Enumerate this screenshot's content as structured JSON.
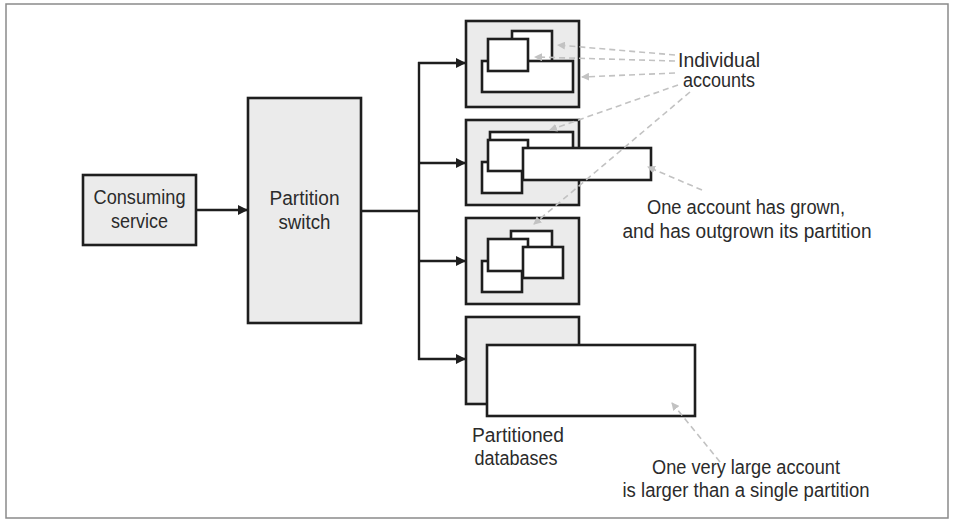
{
  "diagram": {
    "consuming_service": {
      "line1": "Consuming",
      "line2": "service"
    },
    "partition_switch": {
      "line1": "Partition",
      "line2": "switch"
    },
    "partitioned_databases": {
      "line1": "Partitioned",
      "line2": "databases"
    },
    "partitions": [
      {
        "name": "partition-1",
        "accounts": 3
      },
      {
        "name": "partition-2",
        "accounts": 4,
        "note": "one account outgrown"
      },
      {
        "name": "partition-3",
        "accounts": 4
      },
      {
        "name": "partition-4",
        "accounts": 1,
        "note": "very large account exceeds partition"
      }
    ],
    "callouts": {
      "individual_accounts": {
        "line1": "Individual",
        "line2": "accounts"
      },
      "outgrown": {
        "line1": "One account has grown,",
        "line2": "and has outgrown its partition"
      },
      "very_large": {
        "line1": "One very large account",
        "line2": "is larger than a single partition"
      }
    }
  },
  "colors": {
    "box_fill": "#ebebeb",
    "stroke": "#1e1e1e",
    "callout_line": "#c2c2c2",
    "frame_border": "#8a8a8a",
    "text": "#2b2b2b"
  }
}
